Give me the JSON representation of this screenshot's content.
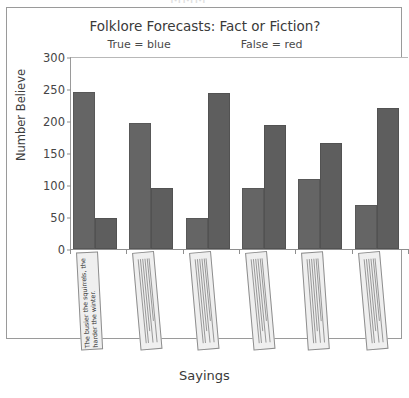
{
  "artifact": {
    "top_text": "MMM"
  },
  "chart_data": {
    "type": "bar",
    "title": "Folklore Forecasts: Fact or Fiction?",
    "subtitle_left": "True = blue",
    "subtitle_right": "False = red",
    "xlabel": "Sayings",
    "ylabel": "Number Believe",
    "ylim": [
      0,
      300
    ],
    "yticks": [
      0,
      50,
      100,
      150,
      200,
      250,
      300
    ],
    "grid": false,
    "legend_position": "top-inside",
    "categories": [
      "The busier the squirrels, the harder the winter.",
      "",
      "",
      "",
      "",
      ""
    ],
    "category_labels_visible": [
      true,
      false,
      false,
      false,
      false,
      false
    ],
    "series": [
      {
        "name": "True",
        "color": "#656565",
        "values": [
          246,
          197,
          49,
          96,
          110,
          68
        ]
      },
      {
        "name": "False",
        "color": "#5e5e5e",
        "values": [
          48,
          96,
          244,
          194,
          166,
          221
        ]
      }
    ]
  }
}
